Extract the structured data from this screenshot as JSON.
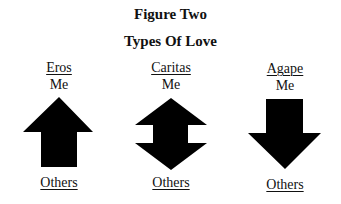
{
  "figure": {
    "title": "Figure Two",
    "subtitle": "Types Of Love"
  },
  "types": [
    {
      "name": "Eros",
      "top_label": "Me",
      "bottom_label": "Others",
      "arrow": "up-arrow",
      "direction": "up"
    },
    {
      "name": "Caritas",
      "top_label": "Me",
      "bottom_label": "Others",
      "arrow": "double-arrow",
      "direction": "up-and-down"
    },
    {
      "name": "Agape",
      "top_label": "Me",
      "bottom_label": "Others",
      "arrow": "down-arrow",
      "direction": "down"
    }
  ],
  "colors": {
    "arrow": "#000000",
    "text": "#111111",
    "background": "#ffffff"
  }
}
